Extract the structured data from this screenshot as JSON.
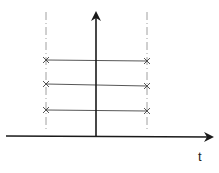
{
  "diagram": {
    "x_axis_label": "t",
    "colors": {
      "axis": "#1a1a1a",
      "line": "#444444",
      "dash": "#888888",
      "marker": "#444444",
      "background": "#ffffff"
    },
    "vertical_axis": {
      "x": 96,
      "y_top": 12,
      "y_bottom": 136
    },
    "horizontal_axis": {
      "y": 136,
      "x_left": 6,
      "x_right": 214
    },
    "dashed_lines": [
      {
        "x": 46,
        "y_top": 12,
        "y_bottom": 132
      },
      {
        "x": 147,
        "y_top": 12,
        "y_bottom": 132
      }
    ],
    "segments": [
      {
        "y": 60,
        "x_start": 46,
        "x_end": 147
      },
      {
        "y": 85,
        "x_start": 46,
        "x_end": 147
      },
      {
        "y": 110,
        "x_start": 46,
        "x_end": 147
      }
    ]
  }
}
